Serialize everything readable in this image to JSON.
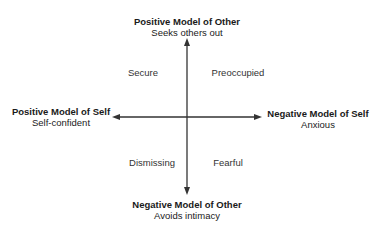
{
  "diagram": {
    "type": "quadrant",
    "axes": {
      "top": {
        "title": "Positive Model of Other",
        "subtitle": "Seeks others out"
      },
      "bottom": {
        "title": "Negative Model of Other",
        "subtitle": "Avoids intimacy"
      },
      "left": {
        "title": "Positive Model of Self",
        "subtitle": "Self-confident"
      },
      "right": {
        "title": "Negative Model of Self",
        "subtitle": "Anxious"
      }
    },
    "quadrants": {
      "top_left": "Secure",
      "top_right": "Preoccupied",
      "bottom_left": "Dismissing",
      "bottom_right": "Fearful"
    },
    "colors": {
      "line": "#333333",
      "text": "#1a1a1a"
    }
  }
}
